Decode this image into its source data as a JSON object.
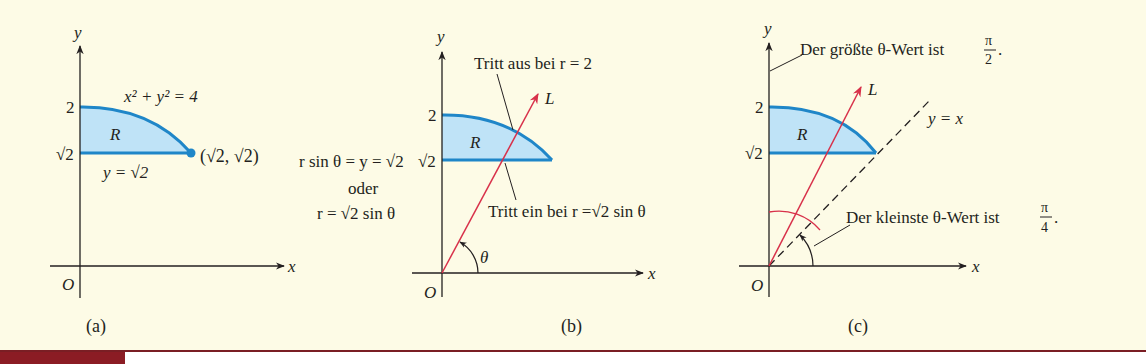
{
  "colors": {
    "background": "#fdfbe6",
    "region_fill": "#bfe3f7",
    "region_stroke": "#1f86c8",
    "ray": "#d8314a",
    "axis": "#231f20",
    "caption_tag": "#8b1c24",
    "caption_rule": "#7a1e24"
  },
  "panels": [
    {
      "id": "a",
      "label": "(a)",
      "axis_x": "x",
      "axis_y": "y",
      "origin": "O",
      "tick_2": "2",
      "tick_sqrt2": "√2",
      "region": "R",
      "circle_eq": "x² + y² = 4",
      "line_eq": "y = √2",
      "point": "(√2,  √2)"
    },
    {
      "id": "b",
      "label": "(b)",
      "axis_x": "x",
      "axis_y": "y",
      "origin": "O",
      "tick_2": "2",
      "tick_sqrt2": "√2",
      "region": "R",
      "ray": "L",
      "angle": "θ",
      "exit_note": "Tritt aus bei r = 2",
      "enter_note": "Tritt ein bei r =√2 sin θ",
      "left_eq_1": "r sin θ = y = √2",
      "left_eq_2": "oder",
      "left_eq_3": "r = √2 sin θ"
    },
    {
      "id": "c",
      "label": "(c)",
      "axis_x": "x",
      "axis_y": "y",
      "origin": "O",
      "tick_2": "2",
      "tick_sqrt2": "√2",
      "region": "R",
      "ray": "L",
      "diag_eq": "y = x",
      "max_note": "Der größte θ-Wert ist",
      "max_num": "π",
      "max_den": "2",
      "min_note": "Der kleinste θ-Wert ist",
      "min_num": "π",
      "min_den": "4",
      "period": "."
    }
  ]
}
